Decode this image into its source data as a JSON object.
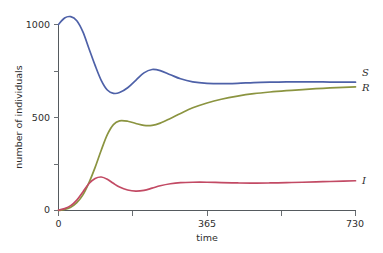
{
  "chart_data": {
    "type": "line",
    "title": "",
    "xlabel": "time",
    "ylabel": "number of individuals",
    "xlim": [
      0,
      730
    ],
    "ylim": [
      0,
      1060
    ],
    "grid": false,
    "legend_position": "right-edge-inline",
    "x_ticks": [
      {
        "value": 0,
        "label": "0",
        "major": true
      },
      {
        "value": 182.5,
        "label": "",
        "major": false
      },
      {
        "value": 365,
        "label": "365",
        "major": true
      },
      {
        "value": 547.5,
        "label": "",
        "major": false
      },
      {
        "value": 730,
        "label": "730",
        "major": true
      }
    ],
    "y_ticks": [
      {
        "value": 0,
        "label": "0",
        "major": true
      },
      {
        "value": 250,
        "label": "",
        "major": false
      },
      {
        "value": 500,
        "label": "500",
        "major": true
      },
      {
        "value": 750,
        "label": "",
        "major": false
      },
      {
        "value": 1000,
        "label": "1000",
        "major": true
      }
    ],
    "series": [
      {
        "name": "S",
        "label": "S",
        "color": "#4e61a8",
        "x": [
          0,
          15,
          30,
          45,
          60,
          75,
          90,
          105,
          120,
          135,
          150,
          170,
          190,
          210,
          230,
          250,
          275,
          300,
          330,
          365,
          400,
          440,
          480,
          520,
          560,
          600,
          650,
          700,
          730
        ],
        "values": [
          1000,
          1035,
          1042,
          1020,
          960,
          870,
          780,
          700,
          648,
          630,
          634,
          660,
          700,
          740,
          758,
          752,
          730,
          708,
          692,
          684,
          682,
          684,
          688,
          690,
          691,
          691,
          691,
          690,
          690
        ]
      },
      {
        "name": "R",
        "label": "R",
        "color": "#8b9440",
        "x": [
          0,
          15,
          30,
          45,
          60,
          75,
          90,
          105,
          120,
          135,
          150,
          170,
          190,
          210,
          230,
          250,
          275,
          300,
          330,
          365,
          400,
          440,
          480,
          520,
          560,
          600,
          650,
          700,
          730
        ],
        "values": [
          0,
          6,
          18,
          42,
          84,
          150,
          232,
          324,
          408,
          462,
          482,
          480,
          468,
          458,
          458,
          470,
          495,
          522,
          552,
          578,
          598,
          615,
          628,
          637,
          644,
          650,
          657,
          662,
          665
        ]
      },
      {
        "name": "I",
        "label": "I",
        "color": "#c24a64",
        "x": [
          0,
          15,
          30,
          45,
          60,
          75,
          90,
          105,
          120,
          135,
          150,
          170,
          190,
          210,
          230,
          250,
          275,
          300,
          330,
          365,
          400,
          440,
          480,
          520,
          560,
          600,
          650,
          700,
          730
        ],
        "values": [
          2,
          10,
          26,
          56,
          100,
          145,
          172,
          180,
          168,
          146,
          126,
          110,
          104,
          108,
          120,
          133,
          144,
          150,
          152,
          152,
          150,
          148,
          147,
          148,
          150,
          152,
          155,
          158,
          160
        ]
      }
    ]
  },
  "axes": {
    "x_title": "time",
    "y_title": "number of individuals"
  },
  "colors": {
    "susceptible": "#4e61a8",
    "recovered": "#8b9440",
    "infected": "#c24a64",
    "axis": "#555a5e",
    "background": "#ffffff"
  }
}
